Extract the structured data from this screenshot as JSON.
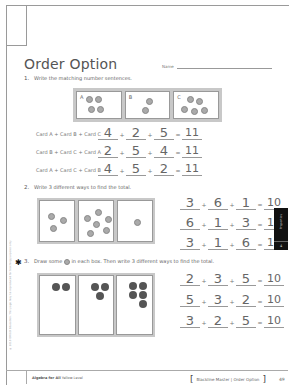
{
  "page": {
    "title": "Order Option",
    "name_label": "Name",
    "name_value": ""
  },
  "question1": {
    "number": "1.",
    "prompt": "Write the matching number sentences.",
    "cards": [
      {
        "letter": "A",
        "dots": 4
      },
      {
        "letter": "B",
        "dots": 2
      },
      {
        "letter": "C",
        "dots": 5
      }
    ],
    "rows": [
      {
        "label": "Card A + Card B + Card C",
        "a": "4",
        "b": "2",
        "c": "5",
        "total": "11"
      },
      {
        "label": "Card B + Card C + Card A",
        "a": "2",
        "b": "5",
        "c": "4",
        "total": "11"
      },
      {
        "label": "Card A + Card C + Card B",
        "a": "4",
        "b": "5",
        "c": "2",
        "total": "11"
      }
    ]
  },
  "question2": {
    "number": "2.",
    "prompt": "Write 3 different ways to find the total.",
    "cards": [
      {
        "dots": 3
      },
      {
        "dots": 6
      },
      {
        "dots": 1
      }
    ],
    "rows": [
      {
        "a": "3",
        "b": "6",
        "c": "1",
        "total": "10"
      },
      {
        "a": "6",
        "b": "1",
        "c": "3",
        "total": "10"
      },
      {
        "a": "3",
        "b": "1",
        "c": "6",
        "total": "10"
      }
    ]
  },
  "question3": {
    "marker": "✱",
    "number": "3.",
    "prompt_before": "Draw some",
    "prompt_after": "in each box. Then write 3 different ways to find the total.",
    "cards": [
      {
        "dots": 2
      },
      {
        "dots": 3
      },
      {
        "dots": 5
      }
    ],
    "rows": [
      {
        "a": "2",
        "b": "3",
        "c": "5",
        "total": "10"
      },
      {
        "a": "5",
        "b": "3",
        "c": "2",
        "total": "10"
      },
      {
        "a": "3",
        "b": "2",
        "c": "5",
        "total": "10"
      }
    ]
  },
  "operators": {
    "plus": "+",
    "equals": "="
  },
  "side_tab": {
    "text": "Properties",
    "number": "4"
  },
  "copyright": "© 2010 ORIGO Education. This page may be reproduced for teaching purposes only.",
  "footer": {
    "left_bold": "Algebra for All",
    "left_rest": "Yellow Level",
    "right_text": "Blackline Master  |  Order Option",
    "page_number": "49"
  }
}
